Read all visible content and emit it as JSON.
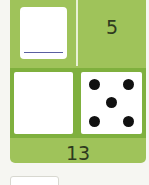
{
  "card": {
    "top_right_number": "5",
    "bottom_number": "13",
    "top_left_box": {
      "content": ""
    },
    "dice": {
      "pips": 5
    },
    "colors": {
      "card": "#9fc35a",
      "band": "#7fb03e",
      "line": "#5a5fa0"
    }
  },
  "answer_box": {
    "value": ""
  }
}
